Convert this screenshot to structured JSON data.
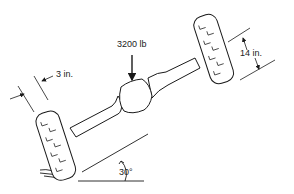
{
  "diagram": {
    "labels": {
      "load": "3200 lb",
      "tire_width": "3 in.",
      "wheel_offset": "14 in.",
      "angle": "30°"
    },
    "colors": {
      "stroke": "#1a1a1a",
      "background": "#ffffff",
      "text": "#222222"
    }
  }
}
